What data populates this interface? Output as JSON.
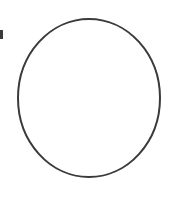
{
  "canvas": {
    "width": 173,
    "height": 201,
    "background_color": "#ffffff"
  },
  "figure": {
    "label": "circle-outline",
    "shape_type": "ellipse",
    "stroke_color": "#3a3a3a",
    "stroke_width": 2,
    "fill_color": "none",
    "center_x": 89,
    "center_y": 98,
    "radius_x": 71,
    "radius_y": 79,
    "bounds": {
      "left": 18,
      "top": 19,
      "right": 160,
      "bottom": 177
    }
  },
  "artifacts": {
    "left_edge_mark": {
      "label": "left-edge-fragment",
      "color": "#3a3a3a",
      "x": 0,
      "y": 30,
      "width": 3,
      "height": 9
    }
  }
}
